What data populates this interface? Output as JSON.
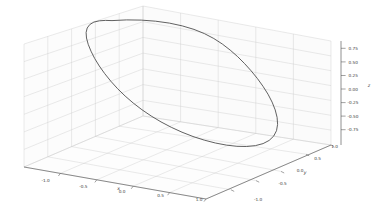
{
  "figure": {
    "width": 377,
    "height": 215,
    "background_color": "#ffffff",
    "pane_color": "#fcfcfc",
    "grid_color": "#c8c8c8",
    "axis_line_color": "#4d4d4d",
    "curve_color": "#4f4f4f",
    "tick_text_color": "#3a3a3a"
  },
  "axes": {
    "x": {
      "label": "x",
      "ticks": [
        "-1.0",
        "-0.5",
        "0.0",
        "0.5",
        "1.0"
      ],
      "tick_values": [
        -1.0,
        -0.5,
        0.0,
        0.5,
        1.0
      ],
      "lim": [
        -1.2,
        1.2
      ]
    },
    "y": {
      "label": "y",
      "ticks": [
        "-1.0",
        "-0.5",
        "0.0",
        "0.5",
        "1.0"
      ],
      "tick_values": [
        -1.0,
        -0.5,
        0.0,
        0.5,
        1.0
      ],
      "lim": [
        -1.2,
        1.2
      ]
    },
    "z": {
      "label": "z",
      "ticks": [
        "0.75",
        "0.50",
        "0.25",
        "0.00",
        "-0.25",
        "-0.50",
        "-0.75"
      ],
      "tick_values": [
        0.75,
        0.5,
        0.25,
        0.0,
        -0.25,
        -0.5,
        -0.75
      ],
      "lim": [
        -1.0,
        1.0
      ]
    }
  },
  "chart_data": {
    "type": "line",
    "projection": "3d",
    "title": "",
    "xlabel": "x",
    "ylabel": "y",
    "zlabel": "z",
    "xlim": [
      -1.2,
      1.2
    ],
    "ylim": [
      -1.2,
      1.2
    ],
    "zlim": [
      -1.0,
      1.0
    ],
    "grid": true,
    "legend": null,
    "series": [
      {
        "name": "closed-loop",
        "closed": true,
        "color": "#4f4f4f",
        "linewidth": 0.9,
        "description": "closed planar elliptical loop (tilted unit circle) drawn in 3D",
        "screen_points": [
          [
            112.0,
            20.6
          ],
          [
            126.6,
            19.9
          ],
          [
            141.2,
            20.1
          ],
          [
            155.6,
            21.2
          ],
          [
            169.4,
            23.1
          ],
          [
            182.3,
            25.9
          ],
          [
            194.0,
            29.4
          ],
          [
            204.4,
            33.6
          ],
          [
            213.8,
            38.5
          ],
          [
            222.3,
            44.0
          ],
          [
            230.2,
            50.1
          ],
          [
            237.6,
            56.6
          ],
          [
            244.6,
            63.6
          ],
          [
            251.2,
            70.9
          ],
          [
            257.4,
            78.5
          ],
          [
            263.0,
            86.3
          ],
          [
            268.0,
            94.2
          ],
          [
            272.1,
            102.1
          ],
          [
            275.2,
            109.9
          ],
          [
            277.1,
            117.4
          ],
          [
            277.6,
            124.4
          ],
          [
            276.5,
            130.7
          ],
          [
            273.7,
            136.1
          ],
          [
            269.2,
            140.4
          ],
          [
            263.1,
            143.6
          ],
          [
            255.5,
            145.6
          ],
          [
            246.7,
            146.5
          ],
          [
            236.9,
            146.3
          ],
          [
            226.4,
            145.1
          ],
          [
            215.4,
            143.0
          ],
          [
            204.2,
            140.1
          ],
          [
            193.0,
            136.5
          ],
          [
            182.0,
            132.2
          ],
          [
            171.3,
            127.3
          ],
          [
            161.0,
            121.9
          ],
          [
            151.2,
            116.0
          ],
          [
            141.9,
            109.7
          ],
          [
            133.2,
            103.0
          ],
          [
            125.1,
            96.0
          ],
          [
            117.6,
            88.7
          ],
          [
            110.8,
            81.2
          ],
          [
            104.7,
            73.6
          ],
          [
            99.3,
            66.0
          ],
          [
            94.7,
            58.5
          ],
          [
            91.0,
            51.2
          ],
          [
            88.2,
            44.3
          ],
          [
            86.5,
            38.0
          ],
          [
            86.1,
            32.5
          ],
          [
            87.2,
            28.0
          ],
          [
            89.8,
            24.5
          ],
          [
            93.9,
            22.1
          ],
          [
            99.4,
            20.8
          ],
          [
            105.5,
            20.4
          ]
        ]
      }
    ]
  },
  "tick_positions": {
    "x": [
      {
        "label": "-1.0",
        "tx": 45.5,
        "ty": 182.2
      },
      {
        "label": "-0.5",
        "tx": 83.3,
        "ty": 188.0
      },
      {
        "label": "0.0",
        "tx": 122.0,
        "ty": 192.7
      },
      {
        "label": "0.5",
        "tx": 160.5,
        "ty": 196.8
      },
      {
        "label": "1.0",
        "tx": 199.0,
        "ty": 200.5
      }
    ],
    "y": [
      {
        "label": "-1.0",
        "tx": 258.0,
        "ty": 200.5
      },
      {
        "label": "-0.5",
        "tx": 282.5,
        "ty": 185.0
      },
      {
        "label": "0.0",
        "tx": 300.0,
        "ty": 172.0
      },
      {
        "label": "0.5",
        "tx": 317.5,
        "ty": 160.0
      },
      {
        "label": "1.0",
        "tx": 334.5,
        "ty": 148.0
      }
    ],
    "z": [
      {
        "label": "0.75",
        "tx": 357.5,
        "ty": 48.3
      },
      {
        "label": "0.50",
        "tx": 357.5,
        "ty": 62.0
      },
      {
        "label": "0.25",
        "tx": 357.5,
        "ty": 75.5
      },
      {
        "label": "0.00",
        "tx": 357.5,
        "ty": 89.0
      },
      {
        "label": "-0.25",
        "tx": 357.0,
        "ty": 102.6
      },
      {
        "label": "-0.50",
        "tx": 357.0,
        "ty": 116.1
      },
      {
        "label": "-0.75",
        "tx": 357.0,
        "ty": 129.7
      }
    ]
  },
  "axis_label_positions": {
    "x": {
      "tx": 118.5,
      "ty": 190.0
    },
    "y": {
      "tx": 305.0,
      "ty": 173.5
    },
    "z": {
      "tx": 369.0,
      "ty": 86.5
    }
  }
}
